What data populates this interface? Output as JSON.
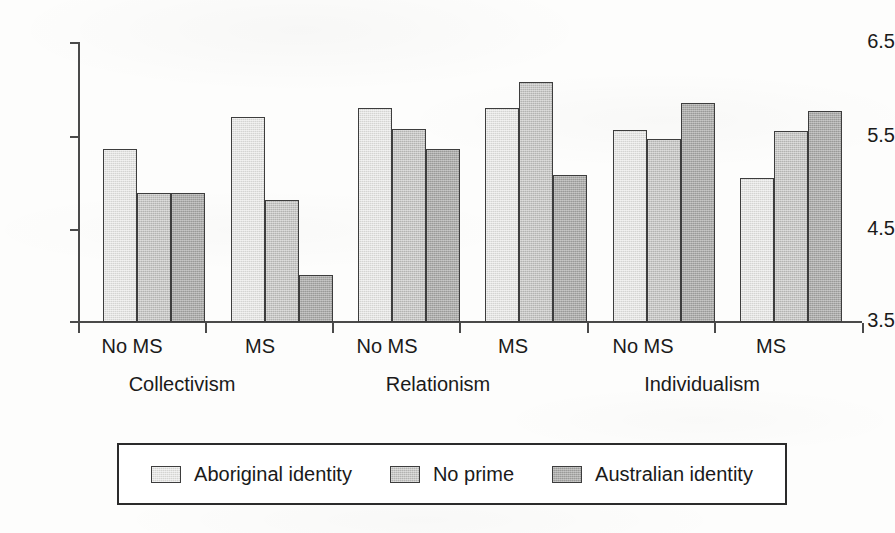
{
  "chart_data": {
    "type": "bar",
    "title": "",
    "subtitle": "",
    "xlabel": "",
    "ylabel": "",
    "ylim": [
      3.5,
      6.5
    ],
    "yticks": [
      3.5,
      4.5,
      5.5,
      6.5
    ],
    "ytick_labels": [
      "3.5",
      "4.5",
      "5.5",
      "6.5"
    ],
    "grid": false,
    "legend_position": "bottom",
    "x_group_labels": [
      "Collectivism",
      "Relationism",
      "Individualism"
    ],
    "x_condition_labels": [
      "No MS",
      "MS",
      "No MS",
      "MS",
      "No MS",
      "MS"
    ],
    "categories": [
      "Collectivism / No MS",
      "Collectivism / MS",
      "Relationism / No MS",
      "Relationism / MS",
      "Individualism / No MS",
      "Individualism / MS"
    ],
    "series": [
      {
        "name": "Aboriginal identity",
        "color": "#d4d4d2",
        "values": [
          5.35,
          5.7,
          5.79,
          5.79,
          5.56,
          5.04
        ]
      },
      {
        "name": "No prime",
        "color": "#b3b3b1",
        "values": [
          4.88,
          4.81,
          5.57,
          6.07,
          5.46,
          5.55
        ]
      },
      {
        "name": "Australian identity",
        "color": "#9a9a98",
        "values": [
          4.88,
          4.0,
          5.35,
          5.08,
          5.85,
          5.76
        ]
      }
    ]
  },
  "legend": {
    "items": [
      {
        "label": "Aboriginal identity",
        "swatch": "#d4d4d2",
        "swatch_name": "legend-swatch-aboriginal"
      },
      {
        "label": "No prime",
        "swatch": "#b3b3b1",
        "swatch_name": "legend-swatch-no-prime"
      },
      {
        "label": "Australian identity",
        "swatch": "#9a9a98",
        "swatch_name": "legend-swatch-australian"
      }
    ]
  },
  "axis": {
    "y_labels": [
      "6.5",
      "5.5",
      "4.5",
      "3.5"
    ],
    "axis_color": "#4a4a4a"
  }
}
